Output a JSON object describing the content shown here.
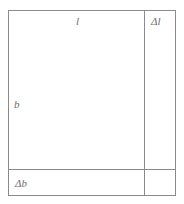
{
  "figure": {
    "name": "rectangle-increment-diagram",
    "stroke_color": "#8a8a8a",
    "text_color": "#6e6e6e",
    "background_color": "#ffffff",
    "stroke_width": 1,
    "outer": {
      "x": 8,
      "y": 10,
      "width": 168,
      "height": 186
    },
    "inner": {
      "x": 8,
      "y": 10,
      "width": 136,
      "height": 159
    },
    "divider_vertical_x": 144,
    "divider_horizontal_y": 169,
    "labels": {
      "length": "l",
      "delta_length": "Δl",
      "breadth": "b",
      "delta_breadth": "Δb"
    }
  }
}
